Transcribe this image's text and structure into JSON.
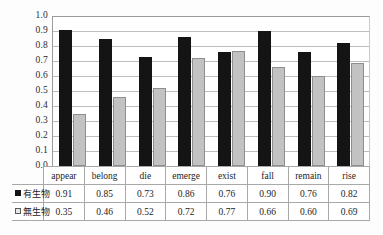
{
  "chart_data": {
    "type": "bar",
    "title": "",
    "xlabel": "",
    "ylabel": "",
    "ylim": [
      0.0,
      1.0
    ],
    "grid": true,
    "legend_position": "table-row-headers",
    "categories": [
      "appear",
      "belong",
      "die",
      "emerge",
      "exist",
      "fall",
      "remain",
      "rise"
    ],
    "ytick_labels": [
      "1.0",
      "0.9",
      "0.8",
      "0.7",
      "0.6",
      "0.5",
      "0.4",
      "0.3",
      "0.2",
      "0.1",
      "0.0"
    ],
    "ytick_values": [
      1.0,
      0.9,
      0.8,
      0.7,
      0.6,
      0.5,
      0.4,
      0.3,
      0.2,
      0.1,
      0.0
    ],
    "series": [
      {
        "name": "有生物",
        "color": "#141414",
        "values": [
          0.91,
          0.85,
          0.73,
          0.86,
          0.76,
          0.9,
          0.76,
          0.82
        ],
        "value_labels": [
          "0.91",
          "0.85",
          "0.73",
          "0.86",
          "0.76",
          "0.90",
          "0.76",
          "0.82"
        ]
      },
      {
        "name": "無生物",
        "color": "#c2c2c2",
        "values": [
          0.35,
          0.46,
          0.52,
          0.72,
          0.77,
          0.66,
          0.6,
          0.69
        ],
        "value_labels": [
          "0.35",
          "0.46",
          "0.52",
          "0.72",
          "0.77",
          "0.66",
          "0.60",
          "0.69"
        ]
      }
    ]
  }
}
